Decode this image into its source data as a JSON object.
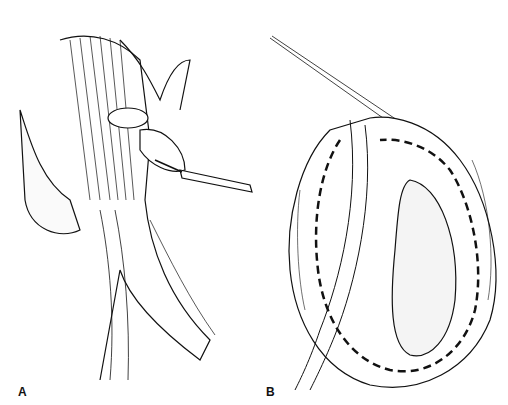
{
  "figure": {
    "panels": [
      {
        "label": "A",
        "description": "Surgical illustration: tendon dissection with scalpel near bone"
      },
      {
        "label": "B",
        "description": "Surgical illustration: tissue sac with dashed incision line and suture"
      }
    ]
  }
}
